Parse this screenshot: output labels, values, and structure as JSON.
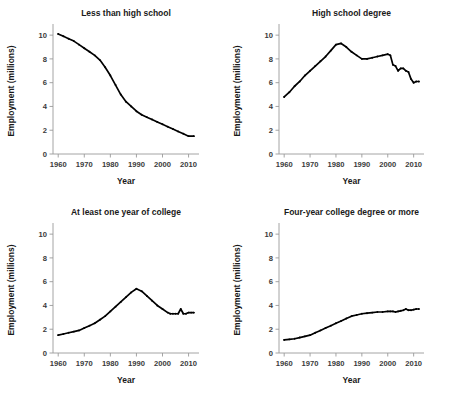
{
  "figure": {
    "title": "",
    "panel_count": 4
  },
  "chart_data": [
    {
      "type": "line",
      "title": "Less than high school",
      "xlabel": "Year",
      "ylabel": "Employment  (millions)",
      "xlim": [
        1958,
        2014
      ],
      "ylim": [
        0,
        10.6
      ],
      "xticks": [
        1960,
        1970,
        1980,
        1990,
        2000,
        2010
      ],
      "yticks": [
        0,
        2,
        4,
        6,
        8,
        10
      ],
      "grid": false,
      "legend": "none",
      "x": [
        1960,
        1962,
        1964,
        1966,
        1968,
        1970,
        1972,
        1974,
        1976,
        1978,
        1980,
        1982,
        1984,
        1986,
        1988,
        1990,
        1992,
        1994,
        1996,
        1998,
        2000,
        2002,
        2004,
        2006,
        2008,
        2010,
        2012
      ],
      "values": [
        10.1,
        9.9,
        9.7,
        9.5,
        9.2,
        8.9,
        8.6,
        8.3,
        7.9,
        7.3,
        6.6,
        5.8,
        5.0,
        4.4,
        4.0,
        3.6,
        3.3,
        3.1,
        2.9,
        2.7,
        2.5,
        2.3,
        2.1,
        1.9,
        1.7,
        1.5,
        1.5
      ]
    },
    {
      "type": "line",
      "title": "High school degree",
      "xlabel": "Year",
      "ylabel": "Employment  (millions)",
      "xlim": [
        1958,
        2014
      ],
      "ylim": [
        0,
        10.6
      ],
      "xticks": [
        1960,
        1970,
        1980,
        1990,
        2000,
        2010
      ],
      "yticks": [
        0,
        2,
        4,
        6,
        8,
        10
      ],
      "grid": false,
      "legend": "none",
      "x": [
        1960,
        1962,
        1964,
        1966,
        1968,
        1970,
        1972,
        1974,
        1976,
        1978,
        1980,
        1982,
        1984,
        1986,
        1988,
        1990,
        1992,
        1994,
        1996,
        1998,
        2000,
        2001,
        2002,
        2003,
        2004,
        2005,
        2006,
        2007,
        2008,
        2009,
        2010,
        2011,
        2012
      ],
      "values": [
        4.8,
        5.2,
        5.7,
        6.1,
        6.6,
        7.0,
        7.4,
        7.8,
        8.2,
        8.7,
        9.2,
        9.3,
        9.0,
        8.6,
        8.3,
        8.0,
        8.0,
        8.1,
        8.2,
        8.3,
        8.4,
        8.3,
        7.5,
        7.4,
        7.0,
        7.2,
        7.2,
        7.0,
        6.9,
        6.3,
        6.0,
        6.1,
        6.1
      ]
    },
    {
      "type": "line",
      "title": "At least one year of college",
      "xlabel": "Year",
      "ylabel": "Employment  (millions)",
      "xlim": [
        1958,
        2014
      ],
      "ylim": [
        0,
        10.6
      ],
      "xticks": [
        1960,
        1970,
        1980,
        1990,
        2000,
        2010
      ],
      "yticks": [
        0,
        2,
        4,
        6,
        8,
        10
      ],
      "grid": false,
      "legend": "none",
      "x": [
        1960,
        1962,
        1964,
        1966,
        1968,
        1970,
        1972,
        1974,
        1976,
        1978,
        1980,
        1982,
        1984,
        1986,
        1988,
        1990,
        1992,
        1994,
        1996,
        1998,
        2000,
        2002,
        2003,
        2004,
        2005,
        2006,
        2007,
        2008,
        2009,
        2010,
        2011,
        2012
      ],
      "values": [
        1.5,
        1.6,
        1.7,
        1.8,
        1.9,
        2.1,
        2.3,
        2.5,
        2.8,
        3.1,
        3.5,
        3.9,
        4.3,
        4.7,
        5.1,
        5.4,
        5.2,
        4.8,
        4.4,
        4.0,
        3.7,
        3.4,
        3.3,
        3.3,
        3.3,
        3.3,
        3.7,
        3.3,
        3.3,
        3.4,
        3.4,
        3.4
      ]
    },
    {
      "type": "line",
      "title": "Four-year college degree or more",
      "xlabel": "Year",
      "ylabel": "Employment  (millions)",
      "xlim": [
        1958,
        2014
      ],
      "ylim": [
        0,
        10.6
      ],
      "xticks": [
        1960,
        1970,
        1980,
        1990,
        2000,
        2010
      ],
      "yticks": [
        0,
        2,
        4,
        6,
        8,
        10
      ],
      "grid": false,
      "legend": "none",
      "x": [
        1960,
        1962,
        1964,
        1966,
        1968,
        1970,
        1972,
        1974,
        1976,
        1978,
        1980,
        1982,
        1984,
        1986,
        1988,
        1990,
        1992,
        1994,
        1996,
        1998,
        2000,
        2001,
        2002,
        2003,
        2004,
        2005,
        2006,
        2007,
        2008,
        2009,
        2010,
        2011,
        2012
      ],
      "values": [
        1.1,
        1.15,
        1.2,
        1.3,
        1.4,
        1.5,
        1.7,
        1.9,
        2.1,
        2.3,
        2.5,
        2.7,
        2.9,
        3.1,
        3.2,
        3.3,
        3.35,
        3.4,
        3.45,
        3.45,
        3.5,
        3.5,
        3.5,
        3.45,
        3.5,
        3.55,
        3.6,
        3.7,
        3.6,
        3.6,
        3.65,
        3.7,
        3.7
      ]
    }
  ]
}
